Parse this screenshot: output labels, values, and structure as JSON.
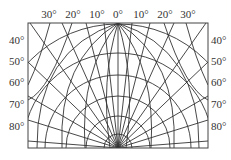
{
  "diagram": {
    "type": "polar-projection-grid",
    "top_labels": [
      {
        "text": "30°",
        "x": 49
      },
      {
        "text": "20°",
        "x": 73
      },
      {
        "text": "10°",
        "x": 97
      },
      {
        "text": "0°",
        "x": 118
      },
      {
        "text": "10°",
        "x": 141
      },
      {
        "text": "20°",
        "x": 165
      },
      {
        "text": "30°",
        "x": 188
      }
    ],
    "left_labels": [
      {
        "text": "40°",
        "y": 37
      },
      {
        "text": "50°",
        "y": 58
      },
      {
        "text": "60°",
        "y": 80
      },
      {
        "text": "70°",
        "y": 102
      },
      {
        "text": "80°",
        "y": 124
      }
    ],
    "right_labels": [
      {
        "text": "40°",
        "y": 37
      },
      {
        "text": "50°",
        "y": 58
      },
      {
        "text": "60°",
        "y": 80
      },
      {
        "text": "70°",
        "y": 102
      },
      {
        "text": "80°",
        "y": 124
      }
    ],
    "line_color": "#333333"
  }
}
